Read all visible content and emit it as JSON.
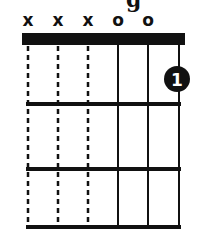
{
  "title_fragment": "g",
  "chord": {
    "strings": [
      "E",
      "A",
      "D",
      "G",
      "B",
      "e"
    ],
    "string_markers": [
      "x",
      "x",
      "x",
      "o",
      "o",
      ""
    ],
    "muted_strings": [
      0,
      1,
      2
    ],
    "open_strings": [
      3,
      4
    ],
    "frets_shown": 3,
    "nut": true,
    "fingerings": [
      {
        "string_index": 5,
        "fret": 1,
        "finger": "1"
      }
    ]
  },
  "colors": {
    "ink": "#111111",
    "background": "#ffffff"
  }
}
